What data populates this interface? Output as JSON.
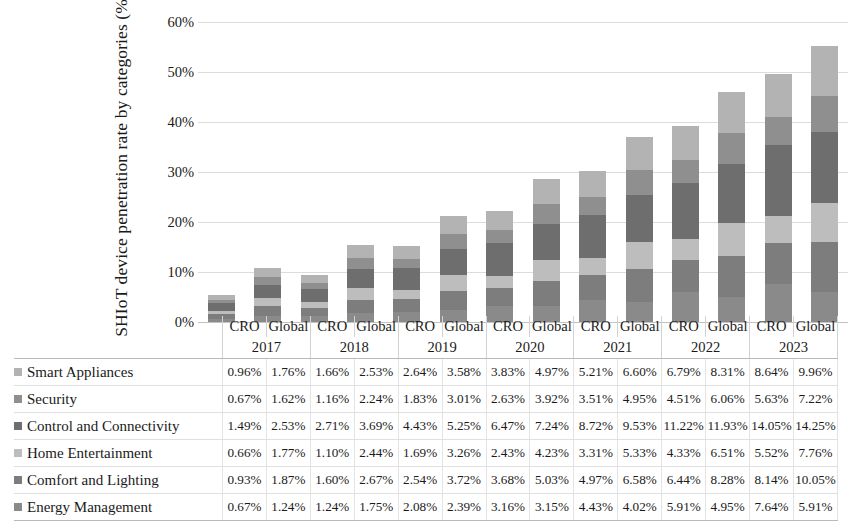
{
  "chart_data": {
    "type": "bar",
    "stacked": true,
    "title": "",
    "xlabel": "",
    "ylabel": "SHIoT device penetration rate by categories (%)",
    "ylim": [
      0,
      60
    ],
    "ytick_labels": [
      "0%",
      "10%",
      "20%",
      "30%",
      "40%",
      "50%",
      "60%"
    ],
    "ytick_values": [
      0,
      10,
      20,
      30,
      40,
      50,
      60
    ],
    "grid": true,
    "legend_position": "table-left",
    "years": [
      "2017",
      "2018",
      "2019",
      "2020",
      "2021",
      "2022",
      "2023"
    ],
    "region_labels": [
      "CRO",
      "Global"
    ],
    "categories": [
      "CRO 2017",
      "Global 2017",
      "CRO 2018",
      "Global 2018",
      "CRO 2019",
      "Global 2019",
      "CRO 2020",
      "Global 2020",
      "CRO 2021",
      "Global 2021",
      "CRO 2022",
      "Global 2022",
      "CRO 2023",
      "Global 2023"
    ],
    "series": [
      {
        "name": "Smart Appliances",
        "color": "#b3b3b3",
        "values": [
          0.96,
          1.76,
          1.66,
          2.53,
          2.64,
          3.58,
          3.83,
          4.97,
          5.21,
          6.6,
          6.79,
          8.31,
          8.64,
          9.96
        ],
        "labels": [
          "0.96%",
          "1.76%",
          "1.66%",
          "2.53%",
          "2.64%",
          "3.58%",
          "3.83%",
          "4.97%",
          "5.21%",
          "6.60%",
          "6.79%",
          "8.31%",
          "8.64%",
          "9.96%"
        ]
      },
      {
        "name": "Security",
        "color": "#8f8f8f",
        "values": [
          0.67,
          1.62,
          1.16,
          2.24,
          1.83,
          3.01,
          2.63,
          3.92,
          3.51,
          4.95,
          4.51,
          6.06,
          5.63,
          7.22
        ],
        "labels": [
          "0.67%",
          "1.62%",
          "1.16%",
          "2.24%",
          "1.83%",
          "3.01%",
          "2.63%",
          "3.92%",
          "3.51%",
          "4.95%",
          "4.51%",
          "6.06%",
          "5.63%",
          "7.22%"
        ]
      },
      {
        "name": "Control and Connectivity",
        "color": "#6e6e6e",
        "values": [
          1.49,
          2.53,
          2.71,
          3.69,
          4.43,
          5.25,
          6.47,
          7.24,
          8.72,
          9.53,
          11.22,
          11.93,
          14.05,
          14.25
        ],
        "labels": [
          "1.49%",
          "2.53%",
          "2.71%",
          "3.69%",
          "4.43%",
          "5.25%",
          "6.47%",
          "7.24%",
          "8.72%",
          "9.53%",
          "11.22%",
          "11.93%",
          "14.05%",
          "14.25%"
        ]
      },
      {
        "name": "Home Entertainment",
        "color": "#bdbdbd",
        "values": [
          0.66,
          1.77,
          1.1,
          2.44,
          1.69,
          3.26,
          2.43,
          4.23,
          3.31,
          5.33,
          4.33,
          6.51,
          5.52,
          7.76
        ],
        "labels": [
          "0.66%",
          "1.77%",
          "1.10%",
          "2.44%",
          "1.69%",
          "3.26%",
          "2.43%",
          "4.23%",
          "3.31%",
          "5.33%",
          "4.33%",
          "6.51%",
          "5.52%",
          "7.76%"
        ]
      },
      {
        "name": "Comfort and Lighting",
        "color": "#7d7d7d",
        "values": [
          0.93,
          1.87,
          1.6,
          2.67,
          2.54,
          3.72,
          3.68,
          5.03,
          4.97,
          6.58,
          6.44,
          8.28,
          8.14,
          10.05
        ],
        "labels": [
          "0.93%",
          "1.87%",
          "1.60%",
          "2.67%",
          "2.54%",
          "3.72%",
          "3.68%",
          "5.03%",
          "4.97%",
          "6.58%",
          "6.44%",
          "8.28%",
          "8.14%",
          "10.05%"
        ]
      },
      {
        "name": "Energy Management",
        "color": "#8a8a8a",
        "values": [
          0.67,
          1.24,
          1.24,
          1.75,
          2.08,
          2.39,
          3.16,
          3.15,
          4.43,
          4.02,
          5.91,
          4.95,
          7.64,
          5.91
        ],
        "labels": [
          "0.67%",
          "1.24%",
          "1.24%",
          "1.75%",
          "2.08%",
          "2.39%",
          "3.16%",
          "3.15%",
          "4.43%",
          "4.02%",
          "5.91%",
          "4.95%",
          "7.64%",
          "5.91%"
        ]
      }
    ],
    "totals": [
      5.38,
      10.79,
      9.47,
      15.32,
      15.21,
      21.21,
      22.2,
      28.54,
      30.15,
      37.01,
      39.2,
      46.04,
      49.62,
      55.15
    ]
  },
  "table": {
    "row_header_blank": "",
    "column_headers": [
      "CRO",
      "Global",
      "CRO",
      "Global",
      "CRO",
      "Global",
      "CRO",
      "Global",
      "CRO",
      "Global",
      "CRO",
      "Global",
      "CRO",
      "Global"
    ],
    "year_headers": [
      "2017",
      "2018",
      "2019",
      "2020",
      "2021",
      "2022",
      "2023"
    ]
  }
}
